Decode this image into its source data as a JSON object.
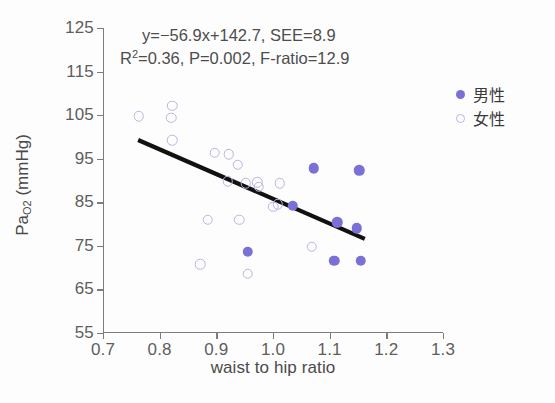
{
  "chart_data": {
    "type": "scatter",
    "title": "",
    "xlabel": "waist to hip ratio",
    "ylabel": "PaO2 (mmHg)",
    "ylabel_base": "Pa",
    "ylabel_sub": "O2",
    "ylabel_unit": " (mmHg)",
    "xlim": [
      0.7,
      1.3
    ],
    "ylim": [
      55,
      125
    ],
    "xticks": [
      "0.7",
      "0.8",
      "0.9",
      "1.0",
      "1.1",
      "1.2",
      "1.3"
    ],
    "yticks": [
      "125",
      "115",
      "105",
      "95",
      "85",
      "75",
      "65",
      "55"
    ],
    "grid": false,
    "legend_position": "right-top",
    "annotations": {
      "line1": "y=−56.9x+142.7,  SEE=8.9",
      "line2_a": "R",
      "line2_sup": "2",
      "line2_b": "=0.36,  P=0.002,  F-ratio=12.9"
    },
    "regression": {
      "slope": -56.9,
      "intercept": 142.7,
      "see": 8.9,
      "r_squared": 0.36,
      "p_value": 0.002,
      "f_ratio": 12.9,
      "x_start": 0.762,
      "y_start": 99.3,
      "x_end": 1.162,
      "y_end": 76.6,
      "color": "#111111"
    },
    "colors": {
      "male_fill": "#7b70d6",
      "female_stroke": "#bab5e3",
      "axis": "#7d7d7d",
      "text": "#4d4d4d",
      "line": "#111111"
    },
    "series": [
      {
        "name": "男性",
        "marker": "filled-circle",
        "color": "#7b70d6",
        "points": [
          [
            1.072,
            92.8
          ],
          [
            1.152,
            92.4
          ],
          [
            1.035,
            84.2
          ],
          [
            1.113,
            80.4
          ],
          [
            1.148,
            79.0
          ],
          [
            0.955,
            73.6
          ],
          [
            1.108,
            71.6
          ],
          [
            1.155,
            71.6
          ]
        ]
      },
      {
        "name": "女性",
        "marker": "open-circle",
        "color": "#bab5e3",
        "points": [
          [
            0.763,
            104.8
          ],
          [
            0.822,
            107.2
          ],
          [
            0.82,
            104.4
          ],
          [
            0.822,
            99.2
          ],
          [
            0.897,
            96.4
          ],
          [
            0.922,
            96.0
          ],
          [
            0.938,
            93.6
          ],
          [
            0.92,
            89.8
          ],
          [
            0.952,
            89.4
          ],
          [
            0.972,
            89.6
          ],
          [
            0.975,
            88.6
          ],
          [
            1.012,
            89.4
          ],
          [
            1.008,
            84.6
          ],
          [
            1.0,
            84.0
          ],
          [
            0.885,
            81.0
          ],
          [
            0.94,
            81.0
          ],
          [
            0.872,
            70.8
          ],
          [
            0.955,
            68.6
          ],
          [
            1.068,
            74.8
          ]
        ]
      }
    ]
  },
  "legend": {
    "items": [
      {
        "label": "男性",
        "marker": "filled"
      },
      {
        "label": "女性",
        "marker": "open"
      }
    ]
  }
}
